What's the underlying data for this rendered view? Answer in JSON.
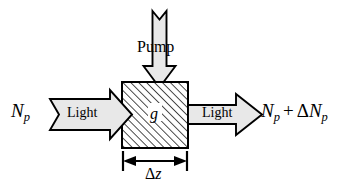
{
  "figure": {
    "kind": "optical-gain-medium-diagram",
    "background_color": "#ffffff",
    "line_color": "#000000",
    "arrow_fill_color": "#e8e8e8",
    "medium_hatch_color": "#2b2b2b",
    "width": 353,
    "height": 192
  },
  "labels": {
    "photon_flux_in": {
      "symbol": "N",
      "subscript": "p",
      "full_text": "N_p"
    },
    "photon_flux_out": {
      "symbol": "N",
      "subscript": "p",
      "operator": "+",
      "delta": "Δ",
      "delta_symbol": "N",
      "delta_subscript": "p",
      "full_text": "N_p + ΔN_p"
    },
    "pump": "Pump",
    "light_in": "Light",
    "light_out": "Light",
    "gain_coefficient": "g",
    "thickness": {
      "delta": "Δ",
      "variable": "z",
      "full_text": "Δz"
    }
  },
  "icons": {
    "pump_arrow": "down-block-arrow-icon",
    "light_in_arrow": "right-block-arrow-icon",
    "light_out_arrow": "right-block-arrow-icon",
    "thickness_dimension": "double-headed-dimension-arrow-icon",
    "gain_medium": "hatched-rectangle-icon"
  }
}
